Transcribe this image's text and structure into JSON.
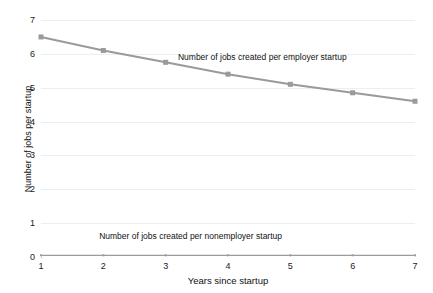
{
  "chart_data": {
    "type": "line",
    "title": "",
    "xlabel": "Years since startup",
    "ylabel": "Number of jobs per startup",
    "x": [
      1,
      2,
      3,
      4,
      5,
      6,
      7
    ],
    "xlim": [
      1,
      7
    ],
    "ylim": [
      0,
      7
    ],
    "xticks": [
      "1",
      "2",
      "3",
      "4",
      "5",
      "6",
      "7"
    ],
    "yticks": [
      "0",
      "1",
      "2",
      "3",
      "4",
      "5",
      "6",
      "7"
    ],
    "grid": "horizontal",
    "legend_position": "inline-annotation",
    "series": [
      {
        "name": "Number of jobs created per employer startup",
        "values": [
          6.5,
          6.1,
          5.75,
          5.4,
          5.1,
          4.85,
          4.6
        ],
        "color": "#9a9a9a",
        "marker": "square",
        "marker_size": 5,
        "line_width": 2,
        "annotation": {
          "text": "Number of jobs created per employer startup",
          "x": 4.55,
          "y": 5.92
        }
      },
      {
        "name": "Number of jobs created per nonemployer startup",
        "values": [
          0.05,
          0.05,
          0.05,
          0.05,
          0.05,
          0.05,
          0.05
        ],
        "color": "#a09a96",
        "marker": "square",
        "marker_size": 2,
        "line_width": 1.2,
        "annotation": {
          "text": "Number of jobs created per nonemployer startup",
          "x": 3.4,
          "y": 0.62
        }
      }
    ]
  },
  "axes": {
    "x_title": "Years since startup",
    "y_title": "Number of jobs per startup"
  },
  "colors": {
    "background": "#ffffff",
    "gridline": "#eceff1",
    "axis": "#b9b9b9",
    "text": "#111111",
    "series_employer": "#9a9a9a",
    "series_nonemployer": "#a09a96"
  }
}
